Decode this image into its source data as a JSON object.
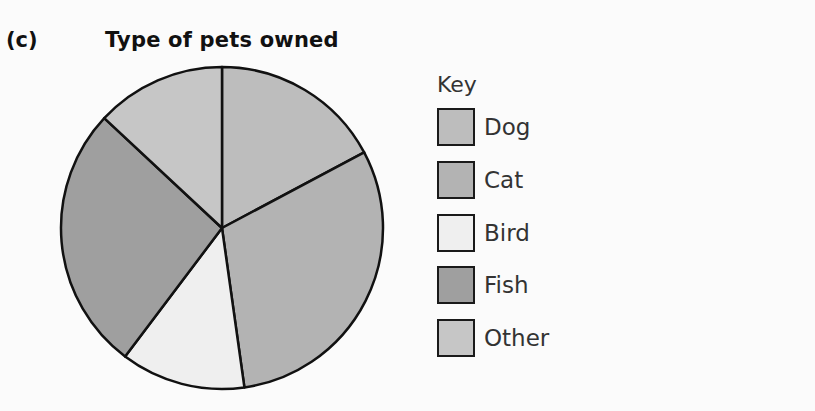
{
  "figure_label": "(c)",
  "title": "Type of pets owned",
  "key": {
    "title": "Key",
    "items": [
      {
        "label": "Dog",
        "color": "#bdbdbd"
      },
      {
        "label": "Cat",
        "color": "#b3b3b3"
      },
      {
        "label": "Bird",
        "color": "#efefef"
      },
      {
        "label": "Fish",
        "color": "#9f9f9f"
      },
      {
        "label": "Other",
        "color": "#c6c6c6"
      }
    ]
  },
  "chart_data": {
    "type": "pie",
    "title": "Type of pets owned",
    "categories": [
      "Dog",
      "Cat",
      "Bird",
      "Fish",
      "Other"
    ],
    "values_degrees": [
      62,
      110,
      45,
      96,
      47
    ],
    "values_percent": [
      17.2,
      30.6,
      12.5,
      26.7,
      13.0
    ],
    "colors": [
      "#bdbdbd",
      "#b3b3b3",
      "#efefef",
      "#9f9f9f",
      "#c6c6c6"
    ],
    "start_angle": "12 o'clock, clockwise",
    "legend": {
      "title": "Key",
      "position": "right"
    },
    "data_labels": false
  }
}
